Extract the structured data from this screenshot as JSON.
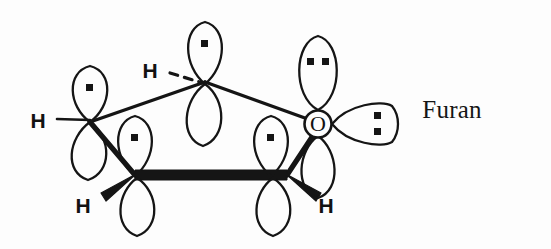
{
  "figure": {
    "compound_name": "Furan",
    "stroke_color": "#151515",
    "background_color": "#fdfdfd"
  },
  "hydrogens": [
    {
      "id": "h-apex",
      "label": "H",
      "x": 150,
      "y": 70,
      "bond_style": "dashed"
    },
    {
      "id": "h-left",
      "label": "H",
      "x": 38,
      "y": 120,
      "bond_style": "plain"
    },
    {
      "id": "h-bottom-left",
      "label": "H",
      "x": 83,
      "y": 205,
      "bond_style": "wedge"
    },
    {
      "id": "h-bottom-right",
      "label": "H",
      "x": 326,
      "y": 205,
      "bond_style": "wedge"
    }
  ],
  "oxygen": {
    "label": "O",
    "x": 318,
    "y": 124,
    "lone_pairs": 2
  },
  "ring": {
    "vertices": [
      {
        "id": "c-left",
        "x": 90,
        "y": 122,
        "element": "C"
      },
      {
        "id": "c-apex",
        "x": 205,
        "y": 82,
        "element": "C"
      },
      {
        "id": "o-right",
        "x": 318,
        "y": 124,
        "element": "O"
      },
      {
        "id": "c-bottom-right",
        "x": 287,
        "y": 175,
        "element": "C"
      },
      {
        "id": "c-bottom-left",
        "x": 135,
        "y": 175,
        "element": "C"
      }
    ],
    "front_bond": "thick"
  },
  "orbitals": [
    {
      "id": "p-left",
      "type": "p-orbital",
      "electrons": 1,
      "orientation": "vertical"
    },
    {
      "id": "p-apex",
      "type": "p-orbital",
      "electrons": 1,
      "orientation": "vertical"
    },
    {
      "id": "p-bottom-left",
      "type": "p-orbital",
      "electrons": 1,
      "orientation": "vertical"
    },
    {
      "id": "p-bottom-right",
      "type": "p-orbital",
      "electrons": 1,
      "orientation": "vertical"
    },
    {
      "id": "p-oxygen",
      "type": "p-orbital",
      "electrons": 2,
      "orientation": "vertical"
    },
    {
      "id": "sp2-oxygen",
      "type": "sp2-lobe",
      "electrons": 2,
      "orientation": "horizontal"
    }
  ]
}
